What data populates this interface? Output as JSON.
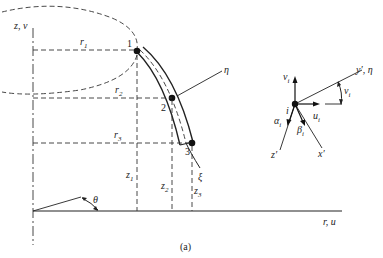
{
  "figure": {
    "caption": "(a)",
    "axes": {
      "vertical_label": "z, v",
      "horizontal_label": "r, u",
      "angle_label": "θ"
    },
    "nodes": [
      {
        "id": "1",
        "r_label": "r",
        "r_sub": "1",
        "z_label": "z",
        "z_sub": "1"
      },
      {
        "id": "2",
        "r_label": "r",
        "r_sub": "2",
        "z_label": "z",
        "z_sub": "2"
      },
      {
        "id": "3",
        "r_label": "r",
        "r_sub": "3",
        "z_label": "z",
        "z_sub": "3"
      }
    ],
    "curve_labels": {
      "eta": "η",
      "xi": "ξ"
    },
    "local_frame": {
      "node_label": "i",
      "v": "v",
      "v_sub": "i",
      "u": "u",
      "u_sub": "i",
      "alpha": "α",
      "alpha_sub": "i",
      "beta": "β",
      "beta_sub": "i",
      "angle": "ν",
      "angle_sub": "i",
      "y_axis": "y′, η",
      "z_axis": "z′",
      "x_axis": "x′"
    }
  }
}
